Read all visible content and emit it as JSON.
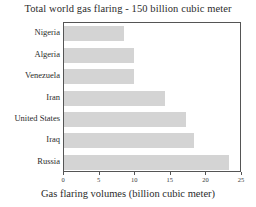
{
  "chart_data": {
    "type": "bar",
    "orientation": "horizontal",
    "title": "Total world gas flaring - 150 billion cubic meter",
    "xlabel": "Gas flaring volumes (billion cubic meter)",
    "ylabel": "",
    "categories": [
      "Nigeria",
      "Algeria",
      "Venezuela",
      "Iran",
      "United States",
      "Iraq",
      "Russia"
    ],
    "values": [
      8.4,
      9.8,
      9.8,
      14.2,
      17.2,
      18.2,
      23.2
    ],
    "xlim": [
      0,
      25
    ],
    "xticks": [
      0,
      5,
      10,
      15,
      20,
      25
    ],
    "xtick_labels": [
      "0",
      "5",
      "10",
      "15",
      "20",
      "25"
    ],
    "grid": false,
    "legend": null,
    "bar_color": "#d4d4d4",
    "frame_color": "#555555"
  }
}
